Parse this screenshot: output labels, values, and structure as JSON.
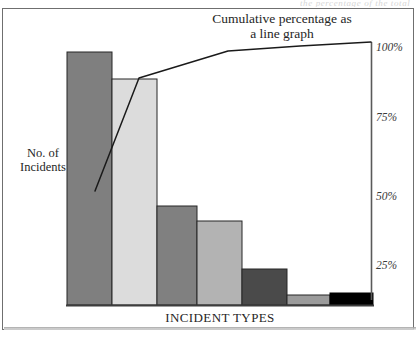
{
  "figure": {
    "top_sliver_text": "the percentage of the total",
    "title_line1": "Cumulative percentage as",
    "title_line2": "a line graph",
    "y_axis_title_line1": "No. of",
    "y_axis_title_line2": "Incidents",
    "x_axis_title": "INCIDENT TYPES"
  },
  "colors": {
    "bar1": "#7f7f7f",
    "bar2": "#dcdcdc",
    "bar3": "#808080",
    "bar4": "#b3b3b3",
    "bar5": "#4a4a4a",
    "bar6": "#9b9b9b",
    "bar7": "#000000",
    "bar_outline": "#262626",
    "line": "#1a1a1a",
    "axis": "#4d4d4d",
    "frame": "#6f6f6f",
    "text": "#262626"
  },
  "chart_data": {
    "type": "bar",
    "title": "Cumulative percentage as a line graph",
    "xlabel": "INCIDENT TYPES",
    "ylabel": "No. of Incidents",
    "secondary_ylabel": "Cumulative percentage",
    "grid": false,
    "legend": null,
    "categories": [
      "1",
      "2",
      "3",
      "4",
      "5",
      "6",
      "7"
    ],
    "values": [
      100,
      89,
      39,
      33,
      14,
      4,
      4
    ],
    "ylim": [
      0,
      100
    ],
    "secondary_y": {
      "tick_labels": [
        "100%",
        "75%",
        "50%",
        "25%"
      ],
      "tick_values": [
        100,
        75,
        50,
        25
      ],
      "ylim": [
        0,
        100
      ]
    },
    "series": [
      {
        "name": "No. of Incidents",
        "type": "bar",
        "values": [
          100,
          89,
          39,
          33,
          14,
          4,
          4
        ]
      },
      {
        "name": "Cumulative percentage",
        "type": "line",
        "values": [
          44,
          90,
          97,
          99,
          100,
          100,
          100
        ]
      }
    ]
  },
  "bars": [
    {
      "name": "bar-1",
      "top": 52,
      "left": 67,
      "width": 45,
      "fill": "#7f7f7f"
    },
    {
      "name": "bar-2",
      "top": 79,
      "left": 112,
      "width": 45,
      "fill": "#dcdcdc"
    },
    {
      "name": "bar-3",
      "top": 206,
      "left": 157,
      "width": 40,
      "fill": "#808080"
    },
    {
      "name": "bar-4",
      "top": 221,
      "left": 197,
      "width": 45,
      "fill": "#b3b3b3"
    },
    {
      "name": "bar-5",
      "top": 269,
      "left": 242,
      "width": 45,
      "fill": "#4a4a4a"
    },
    {
      "name": "bar-6",
      "top": 295,
      "left": 287,
      "width": 43,
      "fill": "#9b9b9b"
    },
    {
      "name": "bar-7",
      "top": 293,
      "left": 330,
      "width": 43,
      "fill": "#000000"
    }
  ],
  "y_ticks": [
    {
      "label": "100%",
      "y": 41
    },
    {
      "label": "75%",
      "y": 111
    },
    {
      "label": "50%",
      "y": 190
    },
    {
      "label": "25%",
      "y": 259
    }
  ]
}
